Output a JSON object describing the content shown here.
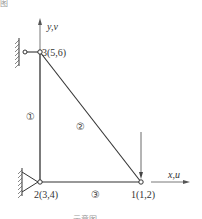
{
  "header_fragment": "图",
  "caption_fragment": "… 示意图 …",
  "axes": {
    "y_label": "y,v",
    "x_label": "x,u"
  },
  "nodes": [
    {
      "id": 1,
      "label": "1(1,2)",
      "x": 141,
      "y": 182,
      "support": "none",
      "load": "downward-force"
    },
    {
      "id": 2,
      "label": "2(3,4)",
      "x": 40,
      "y": 182,
      "support": "pinned"
    },
    {
      "id": 3,
      "label": "3(5,6)",
      "x": 40,
      "y": 52,
      "support": "roller-horizontal-link"
    }
  ],
  "members": [
    {
      "label": "①",
      "from": 2,
      "to": 3
    },
    {
      "label": "②",
      "from": 3,
      "to": 1
    },
    {
      "label": "③",
      "from": 2,
      "to": 1
    }
  ],
  "colors": {
    "line": "#333333",
    "text": "#333333",
    "background": "#ffffff"
  }
}
